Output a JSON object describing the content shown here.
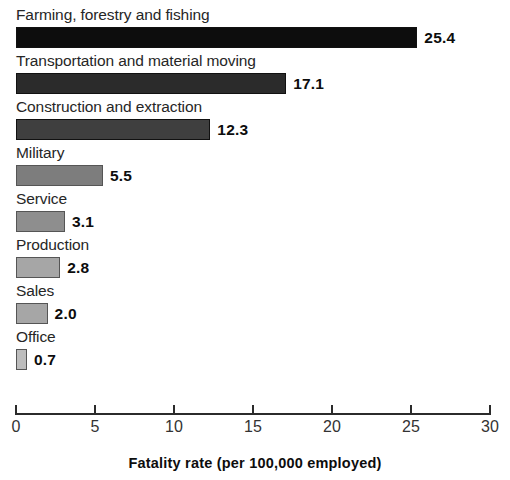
{
  "chart_data": {
    "type": "bar",
    "orientation": "horizontal",
    "title": "",
    "xlabel": "Fatality rate (per 100,000 employed)",
    "ylabel": "",
    "xlim": [
      0,
      30
    ],
    "xticks": [
      0,
      5,
      10,
      15,
      20,
      25,
      30
    ],
    "xtick_labels": [
      "0",
      "5",
      "10",
      "15",
      "20",
      "25",
      "30"
    ],
    "grid": false,
    "legend": false,
    "categories": [
      "Farming, forestry and fishing",
      "Transportation and material moving",
      "Construction and extraction",
      "Military",
      "Service",
      "Production",
      "Sales",
      "Office"
    ],
    "values": [
      25.4,
      17.1,
      12.3,
      5.5,
      3.1,
      2.8,
      2.0,
      0.7
    ],
    "value_labels": [
      "25.4",
      "17.1",
      "12.3",
      "5.5",
      "3.1",
      "2.8",
      "2.0",
      "0.7"
    ],
    "bar_colors": [
      "#0d0d0d",
      "#2b2b2b",
      "#3f3f3f",
      "#7d7d7d",
      "#8e8e8e",
      "#a6a6a6",
      "#a6a6a6",
      "#bdbdbd"
    ]
  },
  "axis": {
    "title": "Fatality rate (per 100,000 employed)",
    "ticks": [
      {
        "value": 0,
        "label": "0"
      },
      {
        "value": 5,
        "label": "5"
      },
      {
        "value": 10,
        "label": "10"
      },
      {
        "value": 15,
        "label": "15"
      },
      {
        "value": 20,
        "label": "20"
      },
      {
        "value": 25,
        "label": "25"
      },
      {
        "value": 30,
        "label": "30"
      }
    ]
  },
  "rows": [
    {
      "label": "Farming, forestry and fishing",
      "value": 25.4,
      "value_label": "25.4",
      "color": "#0d0d0d"
    },
    {
      "label": "Transportation and material moving",
      "value": 17.1,
      "value_label": "17.1",
      "color": "#2b2b2b"
    },
    {
      "label": "Construction and extraction",
      "value": 12.3,
      "value_label": "12.3",
      "color": "#3f3f3f"
    },
    {
      "label": "Military",
      "value": 5.5,
      "value_label": "5.5",
      "color": "#7d7d7d"
    },
    {
      "label": "Service",
      "value": 3.1,
      "value_label": "3.1",
      "color": "#8e8e8e"
    },
    {
      "label": "Production",
      "value": 2.8,
      "value_label": "2.8",
      "color": "#a6a6a6"
    },
    {
      "label": "Sales",
      "value": 2.0,
      "value_label": "2.0",
      "color": "#a6a6a6"
    },
    {
      "label": "Office",
      "value": 0.7,
      "value_label": "0.7",
      "color": "#bdbdbd"
    }
  ]
}
